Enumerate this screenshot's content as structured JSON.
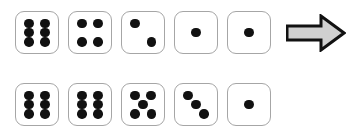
{
  "diagram": {
    "background_color": "#ffffff",
    "die_face_color": "#ffffff",
    "die_border_color": "#a6a6a6",
    "pip_color": "#111111",
    "arrow": {
      "icon": "right-arrow-icon",
      "direction": "right",
      "fill_color": "#d0d0d0",
      "outline_color": "#111111",
      "label": "implies"
    },
    "rows": [
      {
        "name": "top-row",
        "dice": [
          {
            "value": 6,
            "pips": [
              "p-tl",
              "p-tr",
              "p-ml",
              "p-mr",
              "p-bl",
              "p-br"
            ]
          },
          {
            "value": 4,
            "pips": [
              "p-tl",
              "p-tr",
              "p-bl",
              "p-br"
            ]
          },
          {
            "value": 2,
            "pips": [
              "p-tl",
              "p-br"
            ]
          },
          {
            "value": 1,
            "pips": [
              "p-c"
            ]
          },
          {
            "value": 1,
            "pips": [
              "p-c"
            ]
          }
        ],
        "has_arrow": true,
        "total": 14
      },
      {
        "name": "bottom-row",
        "dice": [
          {
            "value": 6,
            "pips": [
              "p-tl",
              "p-tr",
              "p-ml",
              "p-mr",
              "p-bl",
              "p-br"
            ]
          },
          {
            "value": 6,
            "pips": [
              "p-tl",
              "p-tr",
              "p-ml",
              "p-mr",
              "p-bl",
              "p-br"
            ]
          },
          {
            "value": 5,
            "pips": [
              "p-tl",
              "p-tr",
              "p-c",
              "p-bl",
              "p-br"
            ]
          },
          {
            "value": 3,
            "pips": [
              "p-tl",
              "p-c",
              "p-br"
            ]
          },
          {
            "value": 1,
            "pips": [
              "p-c"
            ]
          }
        ],
        "has_arrow": false,
        "total": 21
      }
    ]
  }
}
